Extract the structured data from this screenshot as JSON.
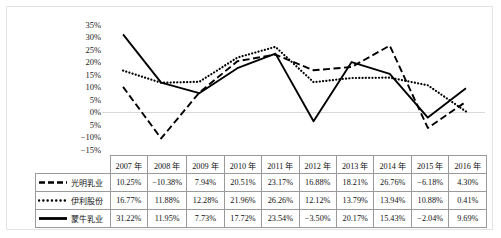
{
  "chart_data": {
    "type": "line",
    "title": "",
    "xlabel": "",
    "ylabel": "",
    "categories": [
      "2007 年",
      "2008 年",
      "2009 年",
      "2010 年",
      "2011 年",
      "2012 年",
      "2013 年",
      "2014 年",
      "2015 年",
      "2016 年"
    ],
    "ylim": [
      -15,
      35
    ],
    "ytick_step": 5,
    "ytick_labels": [
      "35%",
      "30%",
      "25%",
      "20%",
      "15%",
      "10%",
      "5%",
      "0%",
      "5%",
      "−10%",
      "−15%"
    ],
    "ytick_values": [
      35,
      30,
      25,
      20,
      15,
      10,
      5,
      0,
      -5,
      -10,
      -15
    ],
    "grid": "zero-line-only",
    "legend_position": "table-left-column",
    "series": [
      {
        "name": "光明乳业",
        "style": "dashed",
        "color": "#000000",
        "values": [
          10.25,
          -10.38,
          7.94,
          20.51,
          23.17,
          16.88,
          18.21,
          26.76,
          -6.18,
          4.3
        ],
        "labels": [
          "10.25%",
          "−10.38%",
          "7.94%",
          "20.51%",
          "23.17%",
          "16.88%",
          "18.21%",
          "26.76%",
          "−6.18%",
          "4.30%"
        ]
      },
      {
        "name": "伊利股份",
        "style": "dotted",
        "color": "#000000",
        "values": [
          16.77,
          11.88,
          12.28,
          21.96,
          26.26,
          12.12,
          13.79,
          13.94,
          10.88,
          0.41
        ],
        "labels": [
          "16.77%",
          "11.88%",
          "12.28%",
          "21.96%",
          "26.26%",
          "12.12%",
          "13.79%",
          "13.94%",
          "10.88%",
          "0.41%"
        ]
      },
      {
        "name": "蒙牛乳业",
        "style": "solid",
        "color": "#000000",
        "values": [
          31.22,
          11.95,
          7.73,
          17.72,
          23.54,
          -3.5,
          20.17,
          15.43,
          -2.04,
          9.69
        ],
        "labels": [
          "31.22%",
          "11.95%",
          "7.73%",
          "17.72%",
          "23.54%",
          "−3.50%",
          "20.17%",
          "15.43%",
          "−2.04%",
          "9.69%"
        ]
      }
    ]
  },
  "table": {
    "corner_label": "",
    "headers": [
      "2007 年",
      "2008 年",
      "2009 年",
      "2010 年",
      "2011 年",
      "2012 年",
      "2013 年",
      "2014 年",
      "2015 年",
      "2016 年"
    ],
    "rows": [
      {
        "name": "光明乳业",
        "marker": "dashed-line-marker",
        "cells": [
          "10.25%",
          "−10.38%",
          "7.94%",
          "20.51%",
          "23.17%",
          "16.88%",
          "18.21%",
          "26.76%",
          "−6.18%",
          "4.30%"
        ]
      },
      {
        "name": "伊利股份",
        "marker": "dotted-line-marker",
        "cells": [
          "16.77%",
          "11.88%",
          "12.28%",
          "21.96%",
          "26.26%",
          "12.12%",
          "13.79%",
          "13.94%",
          "10.88%",
          "0.41%"
        ]
      },
      {
        "name": "蒙牛乳业",
        "marker": "solid-line-marker",
        "cells": [
          "31.22%",
          "11.95%",
          "7.73%",
          "17.72%",
          "23.54%",
          "−3.50%",
          "20.17%",
          "15.43%",
          "−2.04%",
          "9.69%"
        ]
      }
    ]
  },
  "colors": {
    "frame_border": "#e3e3e3",
    "table_border": "#9a9a9a",
    "zero_gridline": "#d9d9d9",
    "line": "#000000",
    "text": "#111111"
  }
}
